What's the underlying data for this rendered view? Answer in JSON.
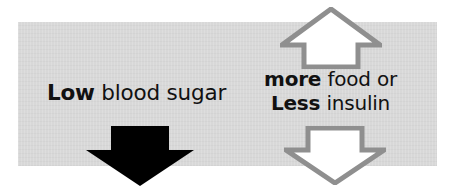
{
  "figure": {
    "background_color": "#ffffff",
    "band_color": "#d7d7d7",
    "ink_color": "#111111",
    "outline_color": "#8f8f8f",
    "hollow_fill_color": "#ffffff",
    "solid_arrow_color": "#000000"
  },
  "left": {
    "cause_bold": "Low",
    "cause_rest": " blood sugar",
    "arrow": {
      "icon_name": "down-arrow-solid-icon",
      "direction": "down",
      "style": "solid-black"
    }
  },
  "right": {
    "line1_bold": "more",
    "line1_rest": " food or",
    "line2_bold": "Less",
    "line2_rest": " insulin",
    "arrow_up": {
      "icon_name": "up-arrow-outline-icon",
      "direction": "up",
      "style": "white-fill-gray-outline"
    },
    "arrow_down": {
      "icon_name": "down-arrow-outline-icon",
      "direction": "down",
      "style": "white-fill-gray-outline"
    }
  }
}
